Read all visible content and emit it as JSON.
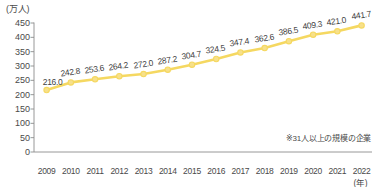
{
  "chart_data": {
    "type": "line",
    "title": "",
    "subtitle": "",
    "xlabel": "(年)",
    "ylabel": "(万人)",
    "ylim": [
      0,
      450
    ],
    "yticks": [
      0,
      50,
      100,
      150,
      200,
      250,
      300,
      350,
      400,
      450
    ],
    "grid": false,
    "legend": "none",
    "annotation": "※31人以上の規模の企業",
    "categories": [
      "2009",
      "2010",
      "2011",
      "2012",
      "2013",
      "2014",
      "2015",
      "2016",
      "2017",
      "2018",
      "2019",
      "2020",
      "2021",
      "2022"
    ],
    "values": [
      216.0,
      242.8,
      253.6,
      264.2,
      272.0,
      287.2,
      304.7,
      324.5,
      347.4,
      362.6,
      386.5,
      409.3,
      421.0,
      441.7
    ],
    "point_labels": [
      "216.0",
      "242.8",
      "253.6",
      "264.2",
      "272.0",
      "287.2",
      "304.7",
      "324.5",
      "347.4",
      "362.6",
      "386.5",
      "409.3",
      "421.0",
      "441.7"
    ],
    "series_color": "#f5d861",
    "marker_color": "#f7e08a",
    "axis_color": "#8c8c8c",
    "label_color": "#4a4a4a"
  }
}
